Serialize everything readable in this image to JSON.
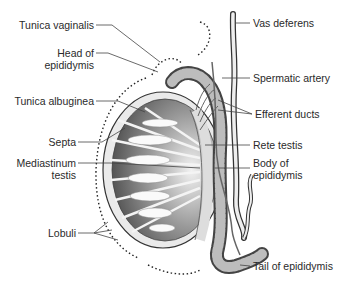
{
  "diagram": {
    "labels_left": [
      {
        "id": "tunica-vaginalis",
        "text": "Tunica vaginalis"
      },
      {
        "id": "head-of-epididymis",
        "line1": "Head of",
        "line2": "epididymis"
      },
      {
        "id": "tunica-albuginea",
        "text": "Tunica albuginea"
      },
      {
        "id": "septa",
        "text": "Septa"
      },
      {
        "id": "mediastinum-testis",
        "line1": "Mediastinum",
        "line2": "testis"
      },
      {
        "id": "lobuli",
        "text": "Lobuli"
      }
    ],
    "labels_right": [
      {
        "id": "vas-deferens",
        "text": "Vas deferens"
      },
      {
        "id": "spermatic-artery",
        "text": "Spermatic artery"
      },
      {
        "id": "efferent-ducts",
        "text": "Efferent ducts"
      },
      {
        "id": "rete-testis",
        "text": "Rete testis"
      },
      {
        "id": "body-of-epididymis",
        "line1": "Body of",
        "line2": "epididymis"
      },
      {
        "id": "tail-of-epididymis",
        "text": "Tail of epididymis"
      }
    ]
  }
}
